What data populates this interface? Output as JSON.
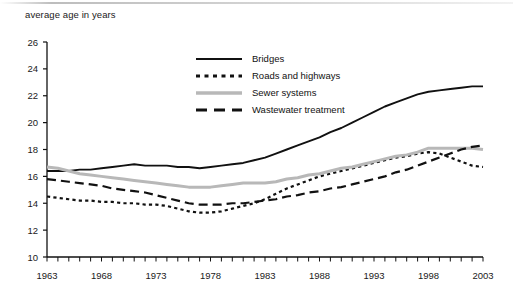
{
  "chart": {
    "y_axis_title": "average age in years",
    "axis": {
      "y_ticks": [
        10,
        12,
        14,
        16,
        18,
        20,
        22,
        24,
        26
      ],
      "x_ticks": [
        1963,
        1968,
        1973,
        1978,
        1983,
        1988,
        1993,
        1998,
        2003
      ]
    },
    "legend": [
      {
        "label": "Bridges",
        "style": "solid",
        "color": "#111111",
        "icon": "solid-line-icon"
      },
      {
        "label": "Roads and highways",
        "style": "dotted",
        "color": "#111111",
        "icon": "dotted-line-icon"
      },
      {
        "label": "Sewer systems",
        "style": "solid",
        "color": "#b8b8b8",
        "icon": "gray-solid-line-icon"
      },
      {
        "label": "Wastewater treatment",
        "style": "dashed",
        "color": "#111111",
        "icon": "dashed-line-icon"
      }
    ]
  },
  "chart_data": {
    "type": "line",
    "title": "",
    "subtitle": "",
    "xlabel": "",
    "ylabel": "average age in years",
    "xlim": [
      1963,
      2003
    ],
    "ylim": [
      10,
      26
    ],
    "grid": false,
    "legend_position": "top-center",
    "x": [
      1963,
      1964,
      1965,
      1966,
      1967,
      1968,
      1969,
      1970,
      1971,
      1972,
      1973,
      1974,
      1975,
      1976,
      1977,
      1978,
      1979,
      1980,
      1981,
      1982,
      1983,
      1984,
      1985,
      1986,
      1987,
      1988,
      1989,
      1990,
      1991,
      1992,
      1993,
      1994,
      1995,
      1996,
      1997,
      1998,
      1999,
      2000,
      2001,
      2002,
      2003
    ],
    "series": [
      {
        "name": "Bridges",
        "color": "#111111",
        "style": "solid",
        "values": [
          16.4,
          16.4,
          16.4,
          16.5,
          16.5,
          16.6,
          16.7,
          16.8,
          16.9,
          16.8,
          16.8,
          16.8,
          16.7,
          16.7,
          16.6,
          16.7,
          16.8,
          16.9,
          17.0,
          17.2,
          17.4,
          17.7,
          18.0,
          18.3,
          18.6,
          18.9,
          19.3,
          19.6,
          20.0,
          20.4,
          20.8,
          21.2,
          21.5,
          21.8,
          22.1,
          22.3,
          22.4,
          22.5,
          22.6,
          22.7,
          22.7
        ]
      },
      {
        "name": "Roads and highways",
        "color": "#111111",
        "style": "dotted",
        "values": [
          14.5,
          14.4,
          14.3,
          14.2,
          14.2,
          14.1,
          14.1,
          14.0,
          14.0,
          13.9,
          13.9,
          13.8,
          13.6,
          13.4,
          13.3,
          13.3,
          13.4,
          13.6,
          13.8,
          14.0,
          14.3,
          14.7,
          15.1,
          15.4,
          15.7,
          16.0,
          16.2,
          16.4,
          16.6,
          16.8,
          17.0,
          17.2,
          17.4,
          17.5,
          17.7,
          17.8,
          17.7,
          17.4,
          17.1,
          16.8,
          16.7
        ]
      },
      {
        "name": "Sewer systems",
        "color": "#b8b8b8",
        "style": "solid",
        "values": [
          16.7,
          16.6,
          16.4,
          16.2,
          16.1,
          16.0,
          15.9,
          15.8,
          15.7,
          15.6,
          15.5,
          15.4,
          15.3,
          15.2,
          15.2,
          15.2,
          15.3,
          15.4,
          15.5,
          15.5,
          15.5,
          15.6,
          15.8,
          15.9,
          16.1,
          16.2,
          16.4,
          16.6,
          16.7,
          16.9,
          17.1,
          17.3,
          17.5,
          17.6,
          17.8,
          18.1,
          18.1,
          18.1,
          18.1,
          18.1,
          18.0
        ]
      },
      {
        "name": "Wastewater treatment",
        "color": "#111111",
        "style": "dashed",
        "values": [
          15.8,
          15.7,
          15.6,
          15.5,
          15.4,
          15.3,
          15.1,
          15.0,
          14.9,
          14.8,
          14.6,
          14.4,
          14.2,
          14.0,
          13.9,
          13.9,
          13.9,
          14.0,
          14.0,
          14.1,
          14.2,
          14.3,
          14.5,
          14.6,
          14.8,
          14.9,
          15.1,
          15.2,
          15.4,
          15.6,
          15.8,
          16.0,
          16.3,
          16.5,
          16.8,
          17.1,
          17.4,
          17.7,
          18.0,
          18.2,
          18.3
        ]
      }
    ]
  }
}
